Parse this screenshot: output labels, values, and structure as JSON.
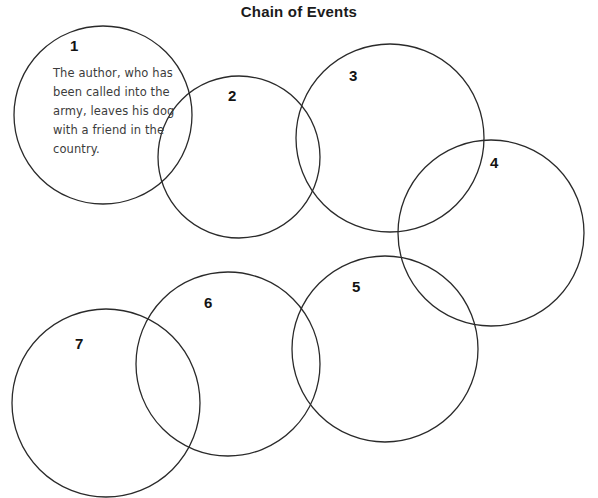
{
  "page": {
    "title": "Chain of Events",
    "background_color": "#ffffff",
    "stroke_color": "#2a2a2a",
    "text_color": "#3c3c3c",
    "number_color": "#131313"
  },
  "chart_data": {
    "type": "diagram",
    "diagram_kind": "chain-of-events-overlapping-circles",
    "title": "Chain of Events",
    "nodes": [
      {
        "number": "1",
        "text": "The author, who has been called into the army, leaves his dog with a friend in the country.",
        "cx": 103,
        "cy": 115,
        "r": 89,
        "number_x": 70,
        "number_y": 38,
        "text_x": 53,
        "text_y": 64,
        "text_width": 125
      },
      {
        "number": "2",
        "text": "",
        "cx": 239,
        "cy": 157,
        "r": 81,
        "number_x": 228,
        "number_y": 88
      },
      {
        "number": "3",
        "text": "",
        "cx": 390,
        "cy": 138,
        "r": 94,
        "number_x": 349,
        "number_y": 68
      },
      {
        "number": "4",
        "text": "",
        "cx": 491,
        "cy": 233,
        "r": 93,
        "number_x": 490,
        "number_y": 155
      },
      {
        "number": "5",
        "text": "",
        "cx": 385,
        "cy": 349,
        "r": 93,
        "number_x": 352,
        "number_y": 279
      },
      {
        "number": "6",
        "text": "",
        "cx": 228,
        "cy": 364,
        "r": 92,
        "number_x": 204,
        "number_y": 295
      },
      {
        "number": "7",
        "text": "",
        "cx": 106,
        "cy": 403,
        "r": 94,
        "number_x": 75,
        "number_y": 336
      }
    ]
  }
}
